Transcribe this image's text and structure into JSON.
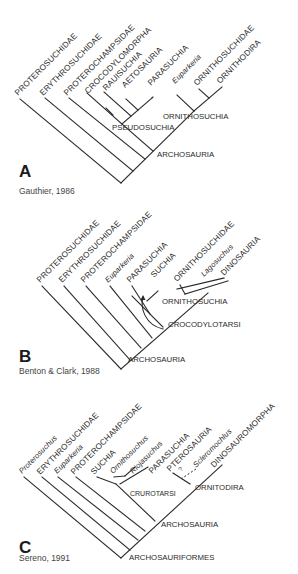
{
  "figure": {
    "panels": [
      {
        "id": "A",
        "letter": "A",
        "citation": "Gauthier, 1986",
        "tips": [
          {
            "label": "PROTEROSUCHIDAE",
            "italic": false
          },
          {
            "label": "ERYTHROSUCHIDAE",
            "italic": false
          },
          {
            "label": "PROTEROCHAMPSIDAE",
            "italic": false
          },
          {
            "label": "CROCODYLOMORPHA",
            "italic": false
          },
          {
            "label": "RAUISUCHIA",
            "italic": false
          },
          {
            "label": "AETOSAURIA",
            "italic": false
          },
          {
            "label": "PARASUCHIA",
            "italic": false
          },
          {
            "label": "Euparkeria",
            "italic": true
          },
          {
            "label": "ORNITHOSUCHIDAE",
            "italic": false
          },
          {
            "label": "ORNITHODIRA",
            "italic": false
          }
        ],
        "nodes": [
          {
            "label": "PSEUDOSUCHIA"
          },
          {
            "label": "ORNITHOSUCHIA"
          },
          {
            "label": "ARCHOSAURIA"
          }
        ]
      },
      {
        "id": "B",
        "letter": "B",
        "citation": "Benton & Clark, 1988",
        "tips": [
          {
            "label": "PROTEROSUCHIDAE",
            "italic": false
          },
          {
            "label": "ERYTHROSUCHIDAE",
            "italic": false
          },
          {
            "label": "PROTEROCHAMPSIDAE",
            "italic": false
          },
          {
            "label": "Euparkeria",
            "italic": true
          },
          {
            "label": "PARASUCHIA",
            "italic": false
          },
          {
            "label": "SUCHIA",
            "italic": false
          },
          {
            "label": "ORNITHOSUCHIDAE",
            "italic": false
          },
          {
            "label": "Lagosuchus",
            "italic": true
          },
          {
            "label": "DINOSAURIA",
            "italic": false
          }
        ],
        "nodes": [
          {
            "label": "ORNITHOSUCHIA"
          },
          {
            "label": "CROCODYLOTARSI"
          },
          {
            "label": "ARCHOSAURIA"
          }
        ]
      },
      {
        "id": "C",
        "letter": "C",
        "citation": "Sereno, 1991",
        "tips": [
          {
            "label": "Proterosuchus",
            "italic": true
          },
          {
            "label": "ERYTHROSUCHIDAE",
            "italic": false
          },
          {
            "label": "Euparkeria",
            "italic": true
          },
          {
            "label": "PROTEROCHAMPSIDAE",
            "italic": false
          },
          {
            "label": "SUCHIA",
            "italic": false
          },
          {
            "label": "Ornithosuchus",
            "italic": true
          },
          {
            "label": "Riojasuchus",
            "italic": true
          },
          {
            "label": "PARASUCHIA",
            "italic": false
          },
          {
            "label": "PTEROSAURIA",
            "italic": false
          },
          {
            "label": "Scleromochlus",
            "italic": true
          },
          {
            "label": "DINOSAUROMORPHA",
            "italic": false
          }
        ],
        "nodes": [
          {
            "label": "CRUROTARSI"
          },
          {
            "label": "ORNITODIRA"
          },
          {
            "label": "ARCHOSAURIA"
          },
          {
            "label": "ARCHOSAURIFORMES"
          }
        ],
        "uncertain_marker": "?"
      }
    ]
  }
}
